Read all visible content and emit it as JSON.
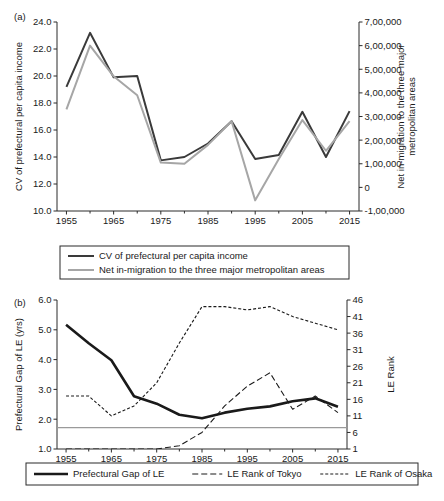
{
  "figure": {
    "panels": [
      {
        "id": "a",
        "label": "(a)",
        "chart_data": {
          "type": "line",
          "title": "",
          "xlabel": "",
          "ylabel": "CV of prefectural per capita income",
          "y2label": "Net in-migration to the three major metropolitan areas",
          "x": [
            1955,
            1960,
            1965,
            1970,
            1975,
            1980,
            1985,
            1990,
            1995,
            2000,
            2005,
            2010,
            2015
          ],
          "xtick_labels": [
            "1955",
            "1965",
            "1975",
            "1985",
            "1995",
            "2005",
            "2015"
          ],
          "xticks_major": [
            1955,
            1965,
            1975,
            1985,
            1995,
            2005,
            2015
          ],
          "xticks_minor": [
            1960,
            1970,
            1980,
            1990,
            2000,
            2010
          ],
          "xlim": [
            1953,
            2017
          ],
          "ylim": [
            10.0,
            24.0
          ],
          "ytick_labels": [
            "10.0",
            "12.0",
            "14.0",
            "16.0",
            "18.0",
            "20.0",
            "22.0",
            "24.0"
          ],
          "yticks": [
            10.0,
            12.0,
            14.0,
            16.0,
            18.0,
            20.0,
            22.0,
            24.0
          ],
          "y2lim": [
            -100000,
            700000
          ],
          "y2tick_labels": [
            "-1,00,000",
            "0",
            "1,00,000",
            "2,00,000",
            "3,00,000",
            "4,00,000",
            "5,00,000",
            "6,00,000",
            "7,00,000"
          ],
          "y2ticks": [
            -100000,
            0,
            100000,
            200000,
            300000,
            400000,
            500000,
            600000,
            700000
          ],
          "grid": false,
          "legend_position": "below",
          "series": [
            {
              "name": "CV of prefectural per capita income",
              "axis": "left",
              "color": "#3a3a3a",
              "width": 2.0,
              "dash": "none",
              "values": [
                19.2,
                23.2,
                19.9,
                20.0,
                13.75,
                14.0,
                15.0,
                16.65,
                13.85,
                14.15,
                17.35,
                14.0,
                17.4
              ]
            },
            {
              "name": "Net in-migration to the three major metropolitan areas",
              "axis": "right",
              "color": "#a6a6a6",
              "width": 2.0,
              "dash": "none",
              "values": [
                330000,
                600000,
                470000,
                390000,
                105000,
                100000,
                180000,
                280000,
                -55000,
                120000,
                285000,
                155000,
                280000
              ]
            }
          ],
          "legend": [
            {
              "label": "CV of prefectural per capita income",
              "color": "#3a3a3a",
              "dash": "none",
              "width": 2.0
            },
            {
              "label": "Net in-migration to the three major metropolitan areas",
              "color": "#a6a6a6",
              "dash": "none",
              "width": 2.0
            }
          ]
        }
      },
      {
        "id": "b",
        "label": "(b)",
        "chart_data": {
          "type": "line",
          "title": "",
          "xlabel": "",
          "ylabel": "Prefectural Gap of LE (yrs)",
          "y2label": "LE Rank",
          "x": [
            1955,
            1960,
            1965,
            1970,
            1975,
            1980,
            1985,
            1990,
            1995,
            2000,
            2005,
            2010,
            2015
          ],
          "xtick_labels": [
            "1955",
            "1965",
            "1975",
            "1985",
            "1995",
            "2005",
            "2015"
          ],
          "xticks_major": [
            1955,
            1965,
            1975,
            1985,
            1995,
            2005,
            2015
          ],
          "xticks_minor": [
            1960,
            1970,
            1980,
            1990,
            2000,
            2010
          ],
          "xlim": [
            1953,
            2017
          ],
          "ylim": [
            1.0,
            6.0
          ],
          "ytick_labels": [
            "1.0",
            "2.0",
            "3.0",
            "4.0",
            "5.0",
            "6.0"
          ],
          "yticks": [
            1.0,
            2.0,
            3.0,
            4.0,
            5.0,
            6.0
          ],
          "y2lim": [
            1,
            46
          ],
          "y2tick_labels": [
            "1",
            "6",
            "11",
            "16",
            "21",
            "26",
            "31",
            "36",
            "41",
            "46"
          ],
          "y2ticks": [
            1,
            6,
            11,
            16,
            21,
            26,
            31,
            36,
            41,
            46
          ],
          "grid": false,
          "legend_position": "below",
          "reference_line": {
            "value": 1.72,
            "axis": "left",
            "color": "#9a9a9a"
          },
          "series": [
            {
              "name": "Prefectural Gap of LE",
              "axis": "left",
              "color": "#1a1a1a",
              "width": 2.6,
              "dash": "none",
              "values": [
                5.17,
                4.55,
                3.98,
                2.77,
                2.52,
                2.15,
                2.03,
                2.22,
                2.35,
                2.43,
                2.6,
                2.7,
                2.42
              ]
            },
            {
              "name": "LE Rank of Tokyo",
              "axis": "right",
              "color": "#1a1a1a",
              "width": 1.1,
              "dash": "6,3",
              "values": [
                1,
                1,
                1,
                1,
                1,
                2,
                6,
                14,
                20,
                24,
                13,
                17,
                12
              ]
            },
            {
              "name": "LE Rank of Osaka",
              "axis": "right",
              "color": "#1a1a1a",
              "width": 1.1,
              "dash": "3,2",
              "values": [
                17,
                17,
                11,
                14,
                21,
                33,
                44,
                44,
                43,
                44,
                41,
                39,
                37
              ]
            }
          ],
          "legend": [
            {
              "label": "Prefectural Gap of LE",
              "color": "#1a1a1a",
              "dash": "none",
              "width": 2.6
            },
            {
              "label": "LE Rank of Tokyo",
              "color": "#1a1a1a",
              "dash": "6,3",
              "width": 1.1
            },
            {
              "label": "LE Rank of Osaka",
              "color": "#1a1a1a",
              "dash": "3,2",
              "width": 1.1
            }
          ]
        }
      }
    ]
  }
}
